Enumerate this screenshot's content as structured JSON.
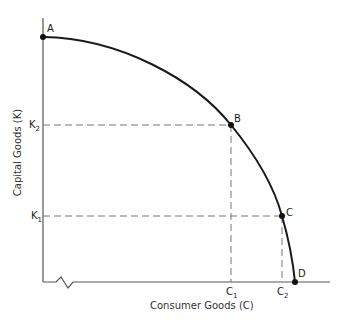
{
  "diagram": {
    "y_axis_label": "Capital Goods (K)",
    "x_axis_label": "Consumer Goods (C)",
    "points": {
      "A": "A",
      "B": "B",
      "C": "C",
      "D": "D"
    },
    "y_ticks": {
      "K2": {
        "base": "K",
        "sub": "2"
      },
      "K1": {
        "base": "K",
        "sub": "1"
      }
    },
    "x_ticks": {
      "C1": {
        "base": "C",
        "sub": "1"
      },
      "C2": {
        "base": "C",
        "sub": "2"
      }
    },
    "colors": {
      "curve": "#1a1a1a",
      "axis": "#555555",
      "dashed": "#777777"
    }
  }
}
